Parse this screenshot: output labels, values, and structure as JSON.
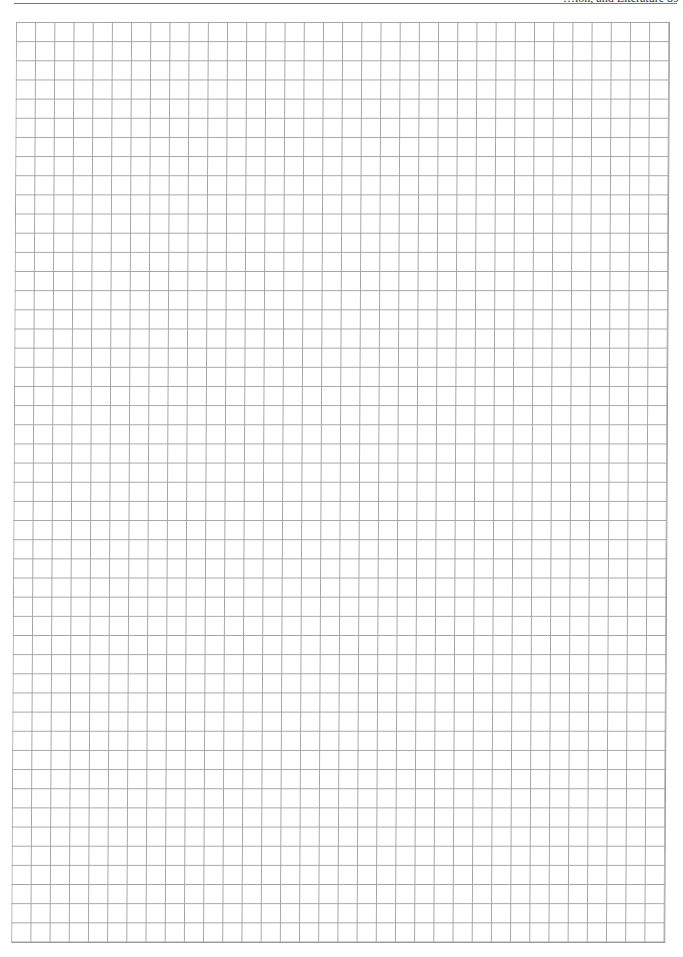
{
  "header": {
    "running_text": "…ion, and Literature",
    "page_number": "89"
  },
  "grid": {
    "columns": 34,
    "rows": 48,
    "cell_width_px": 19.2,
    "cell_height_px": 19.17,
    "line_color": "#a4a4a4",
    "background_color": "#ffffff"
  }
}
